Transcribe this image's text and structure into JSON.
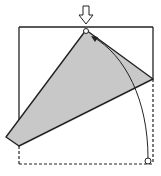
{
  "diagram": {
    "type": "origami-fold-step",
    "colors": {
      "line": "#222222",
      "paper_fill": "#c8c8c8",
      "background": "#ffffff"
    },
    "elements": {
      "square_outline": "solid top and sides, dashed bottom-right region",
      "folded_flap": "gray quadrilateral",
      "push_arrow": "hollow down arrow at top point",
      "fold_arrow": "curved arrow from bottom-right corner to top point",
      "reference_circles": [
        "top point marker",
        "bottom-right corner marker"
      ]
    }
  }
}
